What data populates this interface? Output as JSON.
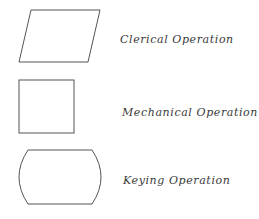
{
  "diagram": {
    "stroke_color": "#555555",
    "text_color": "#3a3a3a",
    "symbols": [
      {
        "shape": "parallelogram",
        "label": "Clerical Operation"
      },
      {
        "shape": "square",
        "label": "Mechanical Operation"
      },
      {
        "shape": "keying-barrel",
        "label": "Keying Operation"
      }
    ]
  }
}
